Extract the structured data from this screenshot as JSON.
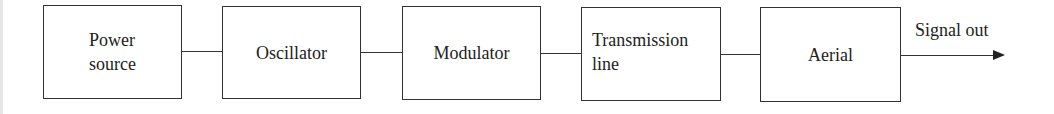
{
  "diagram": {
    "type": "block-diagram",
    "blocks": [
      {
        "id": "power-source",
        "label": "Power\nsource"
      },
      {
        "id": "oscillator",
        "label": "Oscillator"
      },
      {
        "id": "modulator",
        "label": "Modulator"
      },
      {
        "id": "transmission-line",
        "label": "Transmission\nline"
      },
      {
        "id": "aerial",
        "label": "Aerial"
      }
    ],
    "connections": [
      {
        "from": "power-source",
        "to": "oscillator"
      },
      {
        "from": "oscillator",
        "to": "modulator"
      },
      {
        "from": "modulator",
        "to": "transmission-line"
      },
      {
        "from": "transmission-line",
        "to": "aerial"
      }
    ],
    "output": {
      "from": "aerial",
      "label": "Signal out",
      "arrow": true
    }
  }
}
